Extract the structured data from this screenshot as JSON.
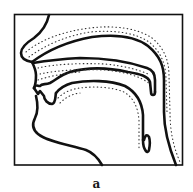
{
  "figure": {
    "type": "sagittal-section-vocal-tract",
    "caption": "a",
    "colors": {
      "line": "#111111",
      "background": "#ffffff"
    }
  }
}
